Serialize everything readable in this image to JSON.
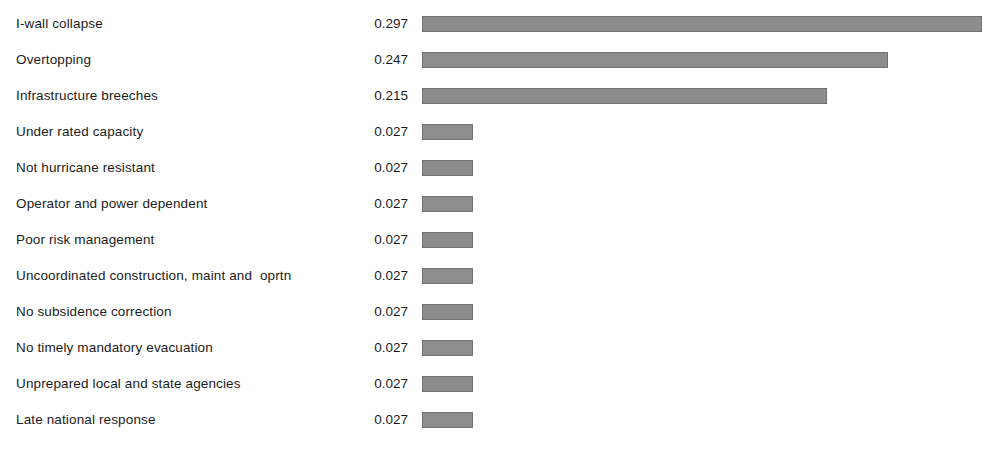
{
  "chart_data": {
    "type": "bar",
    "orientation": "horizontal",
    "title": "",
    "subtitle": "",
    "xlabel": "",
    "ylabel": "",
    "grid": false,
    "legend": null,
    "axis_visible": false,
    "value_labels_visible": true,
    "value_label_format": "0.000",
    "xlim": [
      0,
      0.297
    ],
    "px_per_unit": 1886,
    "bar_origin_px": 422,
    "categories": [
      "I-wall collapse",
      "Overtopping",
      "Infrastructure breeches",
      "Under rated capacity",
      "Not hurricane resistant",
      "Operator and power dependent",
      "Poor risk management",
      "Uncoordinated construction, maint and  oprtn",
      "No subsidence correction",
      "No timely mandatory evacuation",
      "Unprepared local and state agencies",
      "Late national response"
    ],
    "values": [
      0.297,
      0.247,
      0.215,
      0.027,
      0.027,
      0.027,
      0.027,
      0.027,
      0.027,
      0.027,
      0.027,
      0.027
    ],
    "value_labels": [
      "0.297",
      "0.247",
      "0.215",
      "0.027",
      "0.027",
      "0.027",
      "0.027",
      "0.027",
      "0.027",
      "0.027",
      "0.027",
      "0.027"
    ],
    "colors": {
      "bar_fill": "#8d8d8d",
      "bar_border": "#707070",
      "background": "#ffffff",
      "text": "#1c1c1c"
    }
  }
}
